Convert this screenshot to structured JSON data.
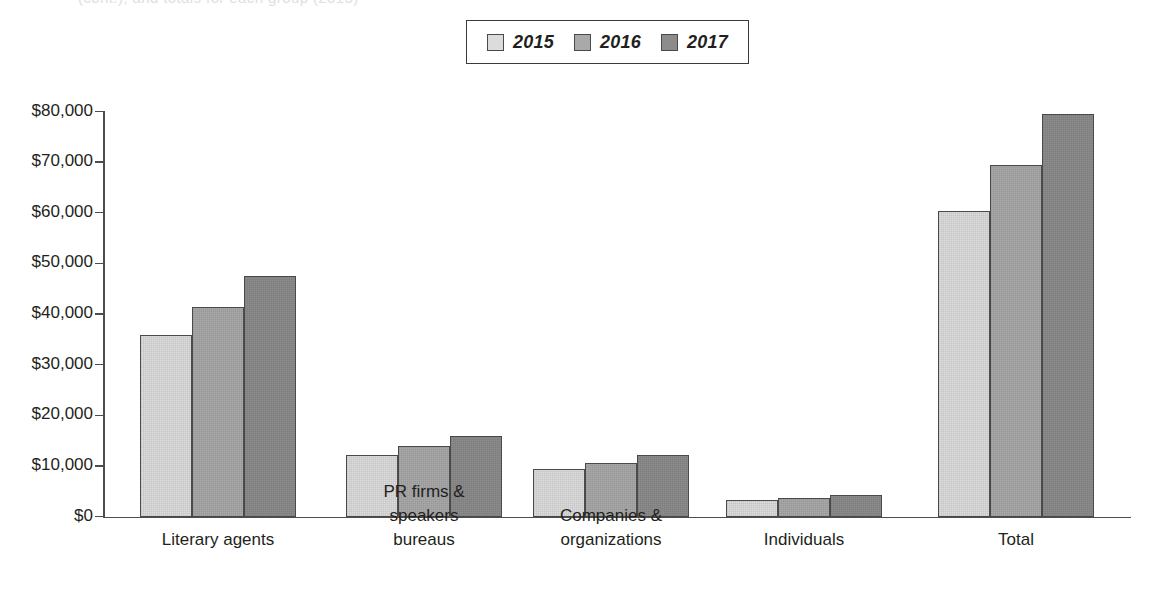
{
  "top_clipped_text": "(cont.), and totals for each group (2015)",
  "legend": {
    "position": "top-center",
    "entries": [
      {
        "label": "2015",
        "color": "#dcdcdc"
      },
      {
        "label": "2016",
        "color": "#a9a9a9"
      },
      {
        "label": "2017",
        "color": "#8c8c8c"
      }
    ]
  },
  "axis": {
    "y_ticks": [
      "$80,000",
      "$70,000",
      "$60,000",
      "$50,000",
      "$40,000",
      "$30,000",
      "$20,000",
      "$10,000",
      "$0"
    ]
  },
  "chart_data": {
    "type": "bar",
    "title": "",
    "xlabel": "",
    "ylabel": "",
    "ylim": [
      0,
      80000
    ],
    "ytick_step": 10000,
    "grid": false,
    "legend_position": "top-center",
    "categories": [
      "Literary agents",
      "PR firms &\nspeakers\nbureaus",
      "Companies &\norganizations",
      "Individuals",
      "Total"
    ],
    "series": [
      {
        "name": "2015",
        "color": "#dcdcdc",
        "values": [
          36000,
          12250,
          9400,
          3300,
          60500
        ]
      },
      {
        "name": "2016",
        "color": "#a9a9a9",
        "values": [
          41400,
          14000,
          10700,
          3800,
          69500
        ]
      },
      {
        "name": "2017",
        "color": "#8c8c8c",
        "values": [
          47700,
          16100,
          12200,
          4400,
          79700
        ]
      }
    ]
  }
}
